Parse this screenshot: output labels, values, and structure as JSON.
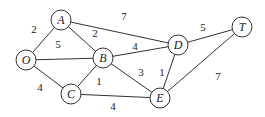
{
  "graph": {
    "nodes": [
      {
        "id": "A",
        "x": 61,
        "y": 20
      },
      {
        "id": "O",
        "x": 26,
        "y": 60
      },
      {
        "id": "B",
        "x": 103,
        "y": 58
      },
      {
        "id": "C",
        "x": 71,
        "y": 94
      },
      {
        "id": "D",
        "x": 178,
        "y": 45
      },
      {
        "id": "T",
        "x": 242,
        "y": 27
      },
      {
        "id": "E",
        "x": 160,
        "y": 98
      }
    ],
    "edges": [
      {
        "from": "O",
        "to": "A",
        "weight": "2",
        "lx": 34,
        "ly": 33
      },
      {
        "from": "O",
        "to": "B",
        "weight": "5",
        "lx": 58,
        "ly": 48
      },
      {
        "from": "O",
        "to": "C",
        "weight": "4",
        "lx": 40,
        "ly": 91
      },
      {
        "from": "A",
        "to": "B",
        "weight": "2",
        "lx": 95,
        "ly": 37
      },
      {
        "from": "A",
        "to": "D",
        "weight": "7",
        "lx": 124,
        "ly": 20
      },
      {
        "from": "B",
        "to": "D",
        "weight": "4",
        "lx": 135,
        "ly": 50
      },
      {
        "from": "B",
        "to": "C",
        "weight": "1",
        "lx": 99,
        "ly": 85
      },
      {
        "from": "B",
        "to": "E",
        "weight": "3",
        "lx": 141,
        "ly": 76
      },
      {
        "from": "C",
        "to": "E",
        "weight": "4",
        "lx": 113,
        "ly": 110
      },
      {
        "from": "D",
        "to": "E",
        "weight": "1",
        "lx": 162,
        "ly": 76
      },
      {
        "from": "D",
        "to": "T",
        "weight": "5",
        "lx": 203,
        "ly": 31
      },
      {
        "from": "E",
        "to": "T",
        "weight": "7",
        "lx": 218,
        "ly": 80
      }
    ]
  }
}
